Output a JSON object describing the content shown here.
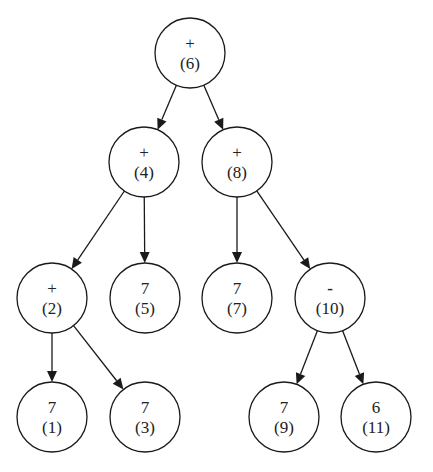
{
  "diagram": {
    "type": "expression-tree",
    "nodes": [
      {
        "id": "6",
        "label": "+",
        "index": "(6)",
        "cx": 190,
        "cy": 53
      },
      {
        "id": "4",
        "label": "+",
        "index": "(4)",
        "cx": 144,
        "cy": 162
      },
      {
        "id": "8",
        "label": "+",
        "index": "(8)",
        "cx": 237,
        "cy": 162
      },
      {
        "id": "2",
        "label": "+",
        "index": "(2)",
        "cx": 52,
        "cy": 298
      },
      {
        "id": "5",
        "label": "7",
        "index": "(5)",
        "cx": 145,
        "cy": 298
      },
      {
        "id": "7",
        "label": "7",
        "index": "(7)",
        "cx": 237,
        "cy": 298
      },
      {
        "id": "10",
        "label": "-",
        "index": "(10)",
        "cx": 330,
        "cy": 298
      },
      {
        "id": "1",
        "label": "7",
        "index": "(1)",
        "cx": 52,
        "cy": 417
      },
      {
        "id": "3",
        "label": "7",
        "index": "(3)",
        "cx": 145,
        "cy": 417
      },
      {
        "id": "9",
        "label": "7",
        "index": "(9)",
        "cx": 284,
        "cy": 417
      },
      {
        "id": "11",
        "label": "6",
        "index": "(11)",
        "cx": 376,
        "cy": 417
      }
    ],
    "edges": [
      {
        "from": "6",
        "to": "4"
      },
      {
        "from": "6",
        "to": "8"
      },
      {
        "from": "4",
        "to": "2"
      },
      {
        "from": "4",
        "to": "5"
      },
      {
        "from": "8",
        "to": "7"
      },
      {
        "from": "8",
        "to": "10"
      },
      {
        "from": "2",
        "to": "1"
      },
      {
        "from": "2",
        "to": "3"
      },
      {
        "from": "10",
        "to": "9"
      },
      {
        "from": "10",
        "to": "11"
      }
    ],
    "node_radius": 35,
    "stroke_color": "#1a1a1a",
    "background": "#ffffff"
  }
}
